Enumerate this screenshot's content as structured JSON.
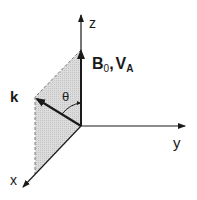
{
  "diagram": {
    "axes": {
      "z": {
        "label": "z"
      },
      "y": {
        "label": "y"
      },
      "x": {
        "label": "x"
      }
    },
    "vectors": {
      "field": {
        "label_main": "B",
        "label_sub": "0",
        "separator": ",",
        "label2_main": "V",
        "label2_sub": "A"
      },
      "wave": {
        "label": "k"
      }
    },
    "angle": {
      "label": "θ"
    },
    "plane": {
      "fill": "#d4d4d4",
      "edge": "#555555"
    },
    "colors": {
      "line": "#1a1a1a",
      "background": "#ffffff"
    }
  }
}
